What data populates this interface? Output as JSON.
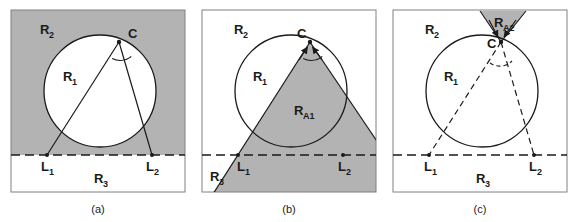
{
  "figure": {
    "background_color": "#ffffff",
    "shade_color": "#b3b3b3",
    "stroke_color": "#1a1a1a",
    "panel_border_color": "#808080",
    "panels": [
      {
        "id": "panel-a",
        "caption": "(a)",
        "frame": {
          "x": 11,
          "y": 10,
          "width": 174,
          "height": 182
        },
        "shaded_description": "region above the horizontal dashed line outside the circle",
        "baseline_y": 155,
        "circle": {
          "cx": 100,
          "cy": 91,
          "r": 56
        },
        "points": {
          "C": {
            "x": 119,
            "y": 42,
            "label": "C"
          },
          "L1": {
            "x": 47,
            "y": 155,
            "label": "L",
            "sub": "1"
          },
          "L2": {
            "x": 152,
            "y": 155,
            "label": "L",
            "sub": "2"
          }
        },
        "region_labels": [
          {
            "name": "R",
            "sub": "2",
            "x": 45,
            "y": 30
          },
          {
            "name": "R",
            "sub": "1",
            "x": 68,
            "y": 78
          },
          {
            "name": "R",
            "sub": "3",
            "x": 100,
            "y": 180
          }
        ],
        "angle_arc": {
          "at": "C",
          "style": "solid"
        },
        "line_style": {
          "CL1": "solid",
          "CL2": "solid",
          "baseline": "dashed"
        }
      },
      {
        "id": "panel-b",
        "caption": "(b)",
        "frame": {
          "x": 202,
          "y": 10,
          "width": 174,
          "height": 182
        },
        "shaded_description": "triangle wedge from C through L1 and L2 extending below the frame",
        "baseline_y": 155,
        "circle": {
          "cx": 291,
          "cy": 91,
          "r": 56
        },
        "points": {
          "C": {
            "x": 310,
            "y": 42,
            "label": "C"
          },
          "L1": {
            "x": 238,
            "y": 155,
            "label": "L",
            "sub": "1"
          },
          "L2": {
            "x": 343,
            "y": 155,
            "label": "L",
            "sub": "2"
          }
        },
        "region_labels": [
          {
            "name": "R",
            "sub": "2",
            "x": 240,
            "y": 30
          },
          {
            "name": "R",
            "sub": "1",
            "x": 258,
            "y": 78
          },
          {
            "name": "R",
            "sub": "A1",
            "x": 300,
            "y": 112
          },
          {
            "name": "R",
            "sub": "3",
            "x": 215,
            "y": 180
          }
        ],
        "angle_arc": {
          "at": "C",
          "style": "solid"
        },
        "arrows": [
          {
            "from": "L1",
            "to": "C",
            "head_at": "C"
          },
          {
            "from": "L2",
            "to": "C",
            "head_at": "C"
          }
        ],
        "line_style": {
          "CL1": "solid",
          "CL2": "solid",
          "baseline": "dashed"
        }
      },
      {
        "id": "panel-c",
        "caption": "(c)",
        "frame": {
          "x": 393,
          "y": 10,
          "width": 174,
          "height": 182
        },
        "shaded_description": "cone opening upward from C above the circle, clipped by the frame top",
        "baseline_y": 155,
        "circle": {
          "cx": 482,
          "cy": 91,
          "r": 56
        },
        "points": {
          "C": {
            "x": 501,
            "y": 42,
            "label": "C"
          },
          "L1": {
            "x": 429,
            "y": 155,
            "label": "L",
            "sub": "1"
          },
          "L2": {
            "x": 534,
            "y": 155,
            "label": "L",
            "sub": "2"
          }
        },
        "region_labels": [
          {
            "name": "R",
            "sub": "2",
            "x": 430,
            "y": 30
          },
          {
            "name": "R",
            "sub": "1",
            "x": 449,
            "y": 78
          },
          {
            "name": "R",
            "sub": "A2",
            "x": 512,
            "y": 24
          },
          {
            "name": "R",
            "sub": "3",
            "x": 482,
            "y": 180
          }
        ],
        "angle_arc": {
          "at": "C",
          "style": "dashed"
        },
        "arrows": [
          {
            "from": "cone-left",
            "to": "C",
            "head_at": "C"
          },
          {
            "from": "cone-right",
            "to": "C",
            "head_at": "C"
          }
        ],
        "line_style": {
          "CL1": "dashed",
          "CL2": "dashed",
          "baseline": "dashed"
        }
      }
    ]
  }
}
